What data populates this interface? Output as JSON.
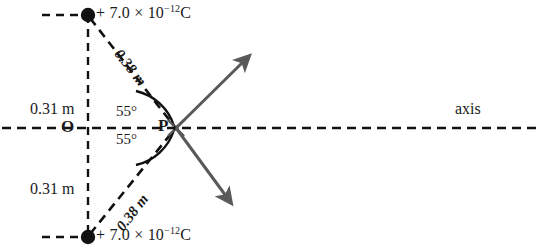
{
  "figure": {
    "type": "physics-diagram",
    "colors": {
      "ink": "#1a1a1a",
      "dashed": "#111111",
      "arrow": "#595959",
      "background": "#ffffff"
    }
  },
  "charges": {
    "top": {
      "label": "+ 7.0 × 10",
      "exponent": "−12",
      "unit": "C",
      "marker": "filled-dot",
      "x": 88,
      "y": 15
    },
    "bottom": {
      "label": "+ 7.0 × 10",
      "exponent": "−12",
      "unit": "C",
      "marker": "filled-dot",
      "x": 88,
      "y": 237
    }
  },
  "points": {
    "origin": {
      "label": "O",
      "x": 68,
      "y": 128
    },
    "field_point": {
      "label": "P",
      "x": 175,
      "y": 128
    }
  },
  "distances": {
    "top_vertical": "0.31 m",
    "bottom_vertical": "0.31 m",
    "top_diagonal": "0.38 m",
    "bottom_diagonal": "0.38 m"
  },
  "angles": {
    "upper": "55°",
    "lower": "55°"
  },
  "axis": {
    "label": "axis"
  },
  "vectors": {
    "upper": {
      "name": "electric-field-vector-upper",
      "direction": "up-right"
    },
    "lower": {
      "name": "electric-field-vector-lower",
      "direction": "down-right"
    }
  }
}
